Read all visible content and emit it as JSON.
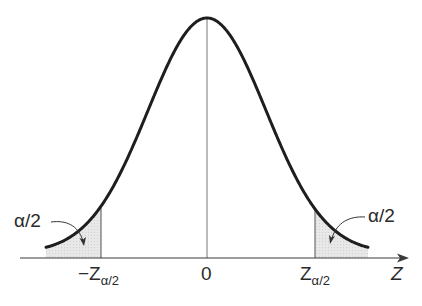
{
  "diagram": {
    "axis_label": "Z",
    "center_label": "0",
    "left_critical_label": {
      "prefix": "−Z",
      "subscript": "α/2"
    },
    "right_critical_label": {
      "prefix": "Z",
      "subscript": "α/2"
    },
    "left_tail_annotation": "α/2",
    "right_tail_annotation": "α/2",
    "colors": {
      "curve": "#1e1e1e",
      "axis": "#3a3a3a",
      "shade": "#e4e4e4",
      "center_line": "#777777"
    }
  }
}
